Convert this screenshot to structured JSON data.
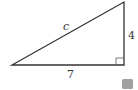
{
  "diagram": {
    "type": "right-triangle",
    "labels": {
      "hypotenuse": "c",
      "vertical_leg": "4",
      "horizontal_leg": "7"
    },
    "colors": {
      "stroke": "#333333",
      "right_angle_marker": "#555555",
      "gray_square": "#a0a0a0"
    }
  }
}
